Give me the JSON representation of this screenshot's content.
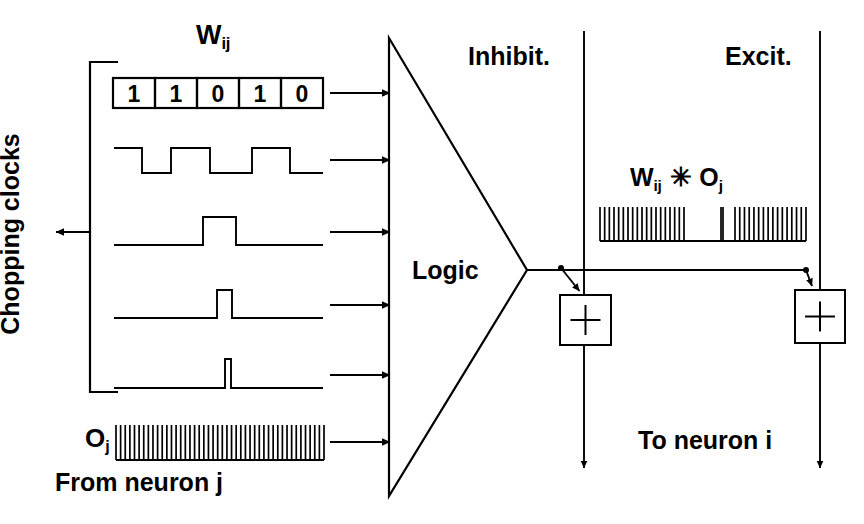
{
  "figure": {
    "domain": "diagram",
    "background": "#ffffff",
    "ink": "#000000",
    "width": 864,
    "height": 524
  },
  "labels": {
    "chopping_clocks": "Chopping clocks",
    "wij_title_base": "W",
    "wij_title_sub": "ij",
    "oj_left_base": "O",
    "oj_left_sub": "j",
    "from_neuron_j": "From neuron j",
    "logic": "Logic",
    "inhibit": "Inhibit.",
    "excit": "Excit.",
    "product_w_base": "W",
    "product_w_sub": "ij",
    "product_operator": "✳",
    "product_o_base": "O",
    "product_o_sub": "j",
    "to_neuron_i": "To neuron i",
    "sum_symbol": "+"
  },
  "weight_register": {
    "name": "Wij",
    "bits": [
      "1",
      "1",
      "0",
      "1",
      "0"
    ],
    "x": 113,
    "y": 78,
    "cell_width": 42,
    "height": 30
  },
  "chopping_clocks_bracket": {
    "x": 90,
    "top": 62,
    "bottom": 392,
    "stub_right": 118,
    "arrow_y": 232,
    "arrow_tip_x": 56
  },
  "input_rows": [
    {
      "name": "weight-register-row",
      "arrow_y": 93
    },
    {
      "name": "clock-waveform-row-1",
      "arrow_y": 160
    },
    {
      "name": "clock-waveform-row-2",
      "arrow_y": 232
    },
    {
      "name": "clock-waveform-row-3",
      "arrow_y": 305
    },
    {
      "name": "clock-waveform-row-4",
      "arrow_y": 375
    },
    {
      "name": "oj-spike-train-row",
      "arrow_y": 442
    }
  ],
  "arrow_geometry": {
    "start_x": 330,
    "end_x": 390
  },
  "waveforms": [
    {
      "name": "square-wave-50-percent",
      "baseline_y": 173,
      "high_y": 148,
      "x_start": 114,
      "x_end": 323,
      "edges": [
        142,
        171,
        210,
        252,
        290
      ],
      "starts_high": true
    },
    {
      "name": "pulse-wide",
      "baseline_y": 245,
      "high_y": 217,
      "x_start": 114,
      "x_end": 323,
      "pulse_start": 203,
      "pulse_end": 236
    },
    {
      "name": "pulse-medium",
      "baseline_y": 318,
      "high_y": 290,
      "x_start": 114,
      "x_end": 323,
      "pulse_start": 217,
      "pulse_end": 232
    },
    {
      "name": "pulse-narrow",
      "baseline_y": 388,
      "high_y": 359,
      "x_start": 114,
      "x_end": 323,
      "pulse_start": 225,
      "pulse_end": 231
    }
  ],
  "spike_trains": [
    {
      "name": "oj-input-spike-train",
      "x_start": 116,
      "x_end": 324,
      "baseline_y": 460,
      "top_y": 425,
      "count": 45,
      "bursts": [
        [
          116,
          324
        ]
      ]
    },
    {
      "name": "wij-times-oj-output-spike-train",
      "x_start": 600,
      "x_end": 806,
      "baseline_y": 241,
      "top_y": 207,
      "bursts": [
        [
          600,
          684
        ],
        [
          721,
          723
        ],
        [
          735,
          806
        ]
      ],
      "counts": [
        22,
        1,
        19
      ]
    }
  ],
  "logic_block": {
    "name": "logic-triangle",
    "left_x": 389,
    "top_y": 38,
    "bottom_y": 496,
    "apex_x": 527,
    "apex_y": 270
  },
  "output_lines": {
    "inhibit_line": {
      "x": 584,
      "top_y": 31,
      "bottom_y": 468
    },
    "excit_line": {
      "x": 820,
      "top_y": 31,
      "bottom_y": 468
    },
    "horizontal_y": 270,
    "horizontal_from_x": 527,
    "horizontal_to_x": 806
  },
  "sum_blocks": [
    {
      "name": "inhibitory-summation-block",
      "x": 560,
      "y": 295,
      "w": 51,
      "h": 50,
      "tap_dot_x": 561,
      "tap_dot_y": 268
    },
    {
      "name": "excitatory-summation-block",
      "x": 795,
      "y": 290,
      "w": 50,
      "h": 53,
      "tap_dot_x": 806,
      "tap_dot_y": 270
    }
  ]
}
